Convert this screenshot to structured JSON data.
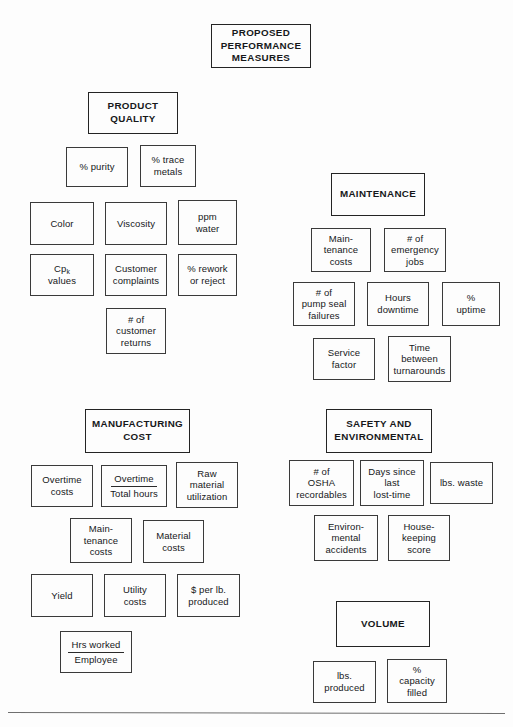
{
  "document": {
    "title": "PROPOSED\nPERFORMANCE\nMEASURES"
  },
  "sections": {
    "product_quality": {
      "title": "PRODUCT\nQUALITY",
      "measures": [
        "% purity",
        "% trace\nmetals",
        "Color",
        "Viscosity",
        "ppm\nwater",
        "Customer\ncomplaints",
        "% rework\nor reject",
        "# of\ncustomer\nreturns"
      ],
      "cpk_prefix": "Cp",
      "cpk_subscript": "k",
      "cpk_suffix": "values"
    },
    "maintenance": {
      "title": "MAINTENANCE",
      "measures": [
        "Main-\ntenance\ncosts",
        "# of\nemergency\njobs",
        "# of\npump seal\nfailures",
        "Hours\ndowntime",
        "%\nuptime",
        "Service\nfactor",
        "Time\nbetween\nturnarounds"
      ]
    },
    "manufacturing_cost": {
      "title": "MANUFACTURING\nCOST",
      "measures": [
        "Overtime\ncosts",
        "Raw\nmaterial\nutilization",
        "Main-\ntenance\ncosts",
        "Material\ncosts",
        "Yield",
        "Utility\ncosts",
        "$ per lb.\nproduced"
      ],
      "fractions": [
        {
          "numerator": "Overtime",
          "denominator": "Total hours"
        },
        {
          "numerator": "Hrs worked",
          "denominator": "Employee"
        }
      ]
    },
    "safety_and_environmental": {
      "title": "SAFETY AND\nENVIRONMENTAL",
      "measures": [
        "# of\nOSHA\nrecordables",
        "Days since\nlast\nlost-time",
        "lbs. waste",
        "Environ-\nmental\naccidents",
        "House-\nkeeping\nscore"
      ]
    },
    "volume": {
      "title": "VOLUME",
      "measures": [
        "lbs.\nproduced",
        "%\ncapacity\nfilled"
      ]
    }
  },
  "colors": {
    "ink": "#16181a",
    "border": "#3a3a3a",
    "header_border": "#242424",
    "page": "#fdfdfd",
    "rule": "#6f6f6f"
  }
}
